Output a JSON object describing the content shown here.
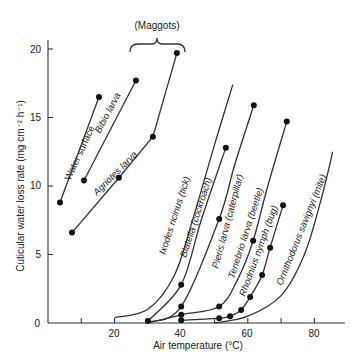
{
  "chart_data": {
    "type": "line",
    "title": "",
    "xlabel": "Air temperature (°C)",
    "ylabel": "Cuticular water loss rate (mg cm⁻² h⁻¹)",
    "xlim": [
      0,
      90
    ],
    "ylim": [
      0,
      22
    ],
    "xticks": [
      0,
      20,
      40,
      60,
      80
    ],
    "xticks_minor": [
      10,
      30,
      50,
      70
    ],
    "yticks": [
      5,
      10,
      15,
      20
    ],
    "grid": false,
    "legend": "none (series labelled inline)",
    "annotations": [
      {
        "text": "(Maggots)",
        "type": "brace",
        "spans_series": [
          "Bibio larva",
          "Agriotes larva"
        ]
      }
    ],
    "series": [
      {
        "name": "Water surface",
        "style": "line",
        "points": [
          [
            3.6,
            8.8
          ],
          [
            15.3,
            16.5
          ]
        ]
      },
      {
        "name": "Bibio larva",
        "style": "line",
        "points": [
          [
            10.8,
            10.4
          ],
          [
            26.4,
            17.7
          ]
        ]
      },
      {
        "name": "Agriotes larva",
        "style": "line",
        "points": [
          [
            7.2,
            6.6
          ],
          [
            21.3,
            10.6
          ],
          [
            31.5,
            13.6
          ],
          [
            38.7,
            19.7
          ]
        ]
      },
      {
        "name": "Ixodes ricinus (tick)",
        "style": "curve",
        "points": [
          [
            20,
            0.4
          ],
          [
            30,
            1.0
          ],
          [
            38,
            3.5
          ],
          [
            44,
            8.0
          ],
          [
            50,
            13.0
          ],
          [
            55.5,
            17.4
          ]
        ],
        "markers": []
      },
      {
        "name": "Blatella (cockroach)",
        "style": "curve",
        "points": [
          [
            30,
            0.15
          ],
          [
            40,
            2.8
          ],
          [
            46,
            7.5
          ],
          [
            53.4,
            12.8
          ]
        ],
        "markers": [
          [
            30,
            0.15
          ],
          [
            40,
            2.8
          ],
          [
            53.4,
            12.8
          ]
        ]
      },
      {
        "name": "Pieris larva (caterpillar)",
        "style": "curve",
        "points": [
          [
            30,
            0.05
          ],
          [
            40,
            1.2
          ],
          [
            51.4,
            7.6
          ],
          [
            56,
            11.5
          ],
          [
            61.8,
            15.9
          ]
        ],
        "markers": [
          [
            40,
            1.2
          ],
          [
            51.4,
            7.6
          ],
          [
            61.8,
            15.9
          ]
        ]
      },
      {
        "name": "Tenebrio larva (beetle)",
        "style": "curve",
        "points": [
          [
            30,
            0.0
          ],
          [
            40,
            0.6
          ],
          [
            51.4,
            1.2
          ],
          [
            57,
            3.2
          ],
          [
            61.6,
            6.0
          ],
          [
            66,
            10.0
          ],
          [
            71.7,
            14.7
          ]
        ],
        "markers": [
          [
            40,
            0.6
          ],
          [
            51.4,
            1.2
          ],
          [
            61.6,
            6.0
          ],
          [
            71.7,
            14.7
          ]
        ]
      },
      {
        "name": "Rhodnius nymph (bug)",
        "style": "curve",
        "points": [
          [
            40,
            0.2
          ],
          [
            51.4,
            0.35
          ],
          [
            54.7,
            0.5
          ],
          [
            58,
            0.95
          ],
          [
            60.7,
            1.9
          ],
          [
            64.3,
            3.5
          ],
          [
            66.7,
            5.5
          ],
          [
            70.6,
            8.6
          ]
        ],
        "markers": [
          [
            40,
            0.2
          ],
          [
            51.4,
            0.35
          ],
          [
            54.7,
            0.5
          ],
          [
            58,
            0.95
          ],
          [
            60.7,
            1.9
          ],
          [
            64.3,
            3.5
          ],
          [
            66.7,
            5.5
          ],
          [
            70.6,
            8.6
          ]
        ]
      },
      {
        "name": "Ornithodorus savignyi (mite)",
        "style": "curve",
        "points": [
          [
            50,
            0.0
          ],
          [
            60,
            0.5
          ],
          [
            70,
            2.0
          ],
          [
            77,
            5.0
          ],
          [
            82,
            9.0
          ],
          [
            85.5,
            12.5
          ]
        ],
        "markers": []
      }
    ]
  },
  "axes": {
    "x_title": "Air temperature (°C)",
    "y_title": "Cuticular water loss rate (mg cm⁻² h⁻¹)",
    "x_tick_labels": [
      "0",
      "20",
      "40",
      "60",
      "80"
    ],
    "y_tick_labels": [
      "5",
      "10",
      "15",
      "20"
    ]
  },
  "labels": {
    "maggots": "(Maggots)",
    "water_surface": "Water surface",
    "bibio": "Bibio larva",
    "agriotes": "Agriotes larva",
    "ixodes": "Ixodes ricinus (tick)",
    "blatella": "Blatella (cockroach)",
    "pieris": "Pieris larva (caterpillar)",
    "tenebrio": "Tenebrio larva (beetle)",
    "rhodnius": "Rhodnius nymph (bug)",
    "ornithodorus": "Ornithodorus savignyi (mite)"
  }
}
